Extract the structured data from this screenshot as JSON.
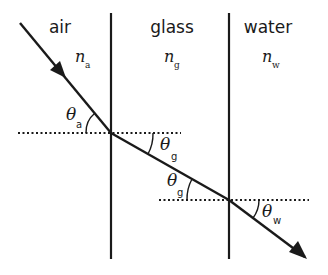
{
  "diagram": {
    "type": "refraction-through-layers",
    "colors": {
      "ink": "#1a1a1a",
      "background": "#ffffff"
    },
    "media": [
      {
        "name": "air",
        "symbol": "n",
        "subscript": "a"
      },
      {
        "name": "glass",
        "symbol": "n",
        "subscript": "g"
      },
      {
        "name": "water",
        "symbol": "n",
        "subscript": "w"
      }
    ],
    "angles": [
      {
        "symbol": "θ",
        "subscript": "a"
      },
      {
        "symbol": "θ",
        "subscript": "g"
      },
      {
        "symbol": "θ",
        "subscript": "g"
      },
      {
        "symbol": "θ",
        "subscript": "w"
      }
    ]
  }
}
